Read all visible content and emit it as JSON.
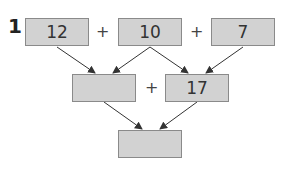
{
  "problem": {
    "number": "1",
    "row1": [
      {
        "value": "12"
      },
      {
        "value": "10"
      },
      {
        "value": "7"
      }
    ],
    "row1_operators": [
      "+",
      "+"
    ],
    "row2": [
      {
        "value": ""
      },
      {
        "value": "17"
      }
    ],
    "row2_operators": [
      "+"
    ],
    "row3": [
      {
        "value": ""
      }
    ]
  },
  "colors": {
    "box_fill": "#d2d2d2",
    "box_border": "#8a8a8a",
    "arrow": "#333333"
  }
}
